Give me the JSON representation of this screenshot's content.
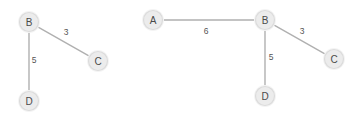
{
  "canvas": {
    "width": 363,
    "height": 119,
    "background": "#ffffff"
  },
  "style": {
    "node_fill": "#ececec",
    "node_stroke": "#dcdcdc",
    "node_halo": "#f4f4f4",
    "edge_stroke": "#b0b0b0",
    "node_label_color": "#4a4a4a",
    "edge_label_color": "#555555",
    "node_radius": 9.5,
    "node_halo_radius": 11
  },
  "graphs": [
    {
      "id": "left-graph",
      "name": "partial-graph",
      "nodes": [
        {
          "id": "B",
          "label": "B",
          "cx": 29,
          "cy": 22
        },
        {
          "id": "C",
          "label": "C",
          "cx": 98,
          "cy": 61
        },
        {
          "id": "D",
          "label": "D",
          "cx": 29,
          "cy": 101
        }
      ],
      "edges": [
        {
          "id": "B-C",
          "from": "B",
          "to": "C",
          "weight": "3",
          "label_x": 66,
          "label_y": 32
        },
        {
          "id": "B-D",
          "from": "B",
          "to": "D",
          "weight": "5",
          "label_x": 34,
          "label_y": 60
        }
      ]
    },
    {
      "id": "right-graph",
      "name": "full-graph",
      "nodes": [
        {
          "id": "A",
          "label": "A",
          "cx": 153,
          "cy": 20
        },
        {
          "id": "B",
          "label": "B",
          "cx": 265,
          "cy": 20
        },
        {
          "id": "C",
          "label": "C",
          "cx": 334,
          "cy": 59
        },
        {
          "id": "D",
          "label": "D",
          "cx": 265,
          "cy": 96
        }
      ],
      "edges": [
        {
          "id": "A-B",
          "from": "A",
          "to": "B",
          "weight": "6",
          "label_x": 206,
          "label_y": 31
        },
        {
          "id": "B-C",
          "from": "B",
          "to": "C",
          "weight": "3",
          "label_x": 302,
          "label_y": 31
        },
        {
          "id": "B-D",
          "from": "B",
          "to": "D",
          "weight": "5",
          "label_x": 271,
          "label_y": 57
        }
      ]
    }
  ]
}
